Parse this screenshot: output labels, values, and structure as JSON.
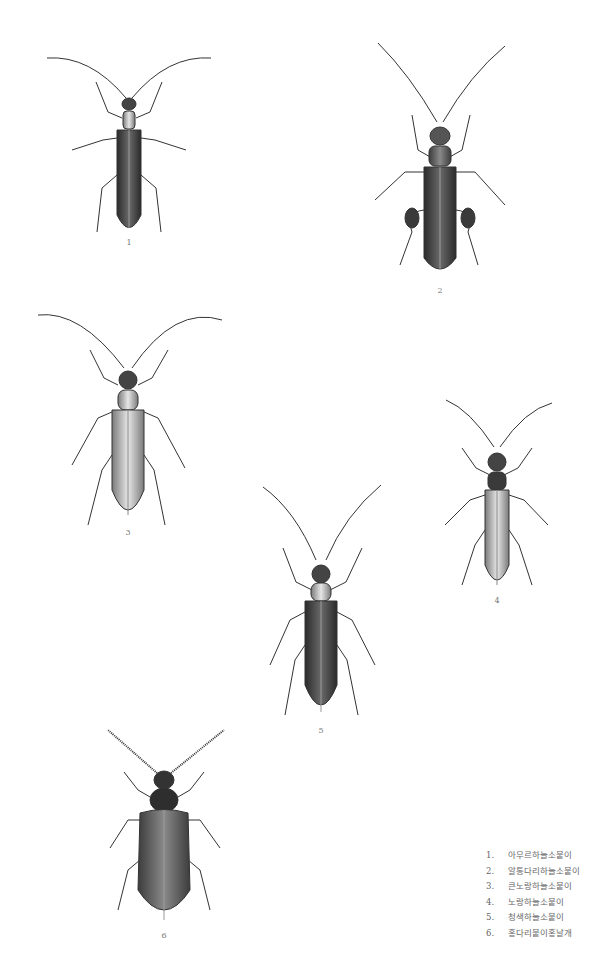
{
  "plate": {
    "background": "#ffffff",
    "specimens": [
      {
        "number": "1",
        "name": "아무르하늘소붙이"
      },
      {
        "number": "2",
        "name": "알통다리하늘소붙이"
      },
      {
        "number": "3",
        "name": "큰노랑하늘소붙이"
      },
      {
        "number": "4",
        "name": "노랑하늘소붙이"
      },
      {
        "number": "5",
        "name": "청색하늘소붙이"
      },
      {
        "number": "6",
        "name": "홍다리붙이홍날개"
      }
    ]
  },
  "legend": {
    "items": [
      {
        "n": "1.",
        "label": "아무르하늘소붙이"
      },
      {
        "n": "2.",
        "label": "알통다리하늘소붙이"
      },
      {
        "n": "3.",
        "label": "큰노랑하늘소붙이"
      },
      {
        "n": "4.",
        "label": "노랑하늘소붙이"
      },
      {
        "n": "5.",
        "label": "청색하늘소붙이"
      },
      {
        "n": "6.",
        "label": "홍다리붙이홍날개"
      }
    ]
  }
}
